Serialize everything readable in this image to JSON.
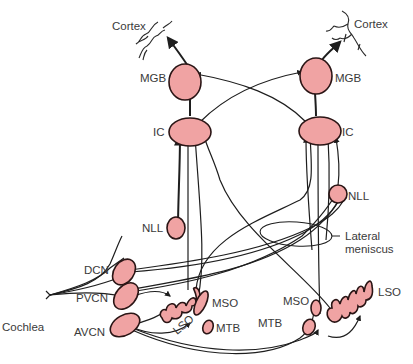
{
  "diagram": {
    "colors": {
      "nucleus_fill": "#f0a3a3",
      "nucleus_stroke": "#2a1515",
      "fiber": "#1e1e1e",
      "label": "#3a3a3a",
      "background": "#ffffff"
    },
    "labels": {
      "cortex_left": "Cortex",
      "cortex_right": "Cortex",
      "mgb_left": "MGB",
      "mgb_right": "MGB",
      "ic_left": "IC",
      "ic_right": "IC",
      "nll_left": "NLL",
      "nll_right": "NLL",
      "lateral_meniscus_1": "Lateral",
      "lateral_meniscus_2": "meniscus",
      "dcn": "DCN",
      "pvcn": "PVCN",
      "avcn": "AVCN",
      "cochlea": "Cochlea",
      "lso_left": "LSO",
      "mso_left": "MSO",
      "mtb_left": "MTB",
      "mso_right": "MSO",
      "mtb_right": "MTB",
      "lso_right": "LSO"
    },
    "nodes": [
      {
        "id": "cortex_left",
        "label": "Cortex"
      },
      {
        "id": "cortex_right",
        "label": "Cortex"
      },
      {
        "id": "mgb_left",
        "label": "MGB"
      },
      {
        "id": "mgb_right",
        "label": "MGB"
      },
      {
        "id": "ic_left",
        "label": "IC"
      },
      {
        "id": "ic_right",
        "label": "IC"
      },
      {
        "id": "nll_left",
        "label": "NLL"
      },
      {
        "id": "nll_right",
        "label": "NLL"
      },
      {
        "id": "dcn",
        "label": "DCN"
      },
      {
        "id": "pvcn",
        "label": "PVCN"
      },
      {
        "id": "avcn",
        "label": "AVCN"
      },
      {
        "id": "lso_left",
        "label": "LSO"
      },
      {
        "id": "mso_left",
        "label": "MSO"
      },
      {
        "id": "mtb_left",
        "label": "MTB"
      },
      {
        "id": "mso_right",
        "label": "MSO"
      },
      {
        "id": "mtb_right",
        "label": "MTB"
      },
      {
        "id": "lso_right",
        "label": "LSO"
      }
    ],
    "edges": [
      {
        "from": "cochlea",
        "to": "dcn"
      },
      {
        "from": "cochlea",
        "to": "pvcn"
      },
      {
        "from": "cochlea",
        "to": "avcn"
      },
      {
        "from": "pvcn",
        "to": "lso_left"
      },
      {
        "from": "avcn",
        "to": "lso_left"
      },
      {
        "from": "avcn",
        "to": "mso_left"
      },
      {
        "from": "avcn",
        "to": "mtb_right"
      },
      {
        "from": "avcn",
        "to": "mso_right"
      },
      {
        "from": "mtb_right",
        "to": "lso_right"
      },
      {
        "from": "dcn",
        "to": "nll_right"
      },
      {
        "from": "pvcn",
        "to": "nll_right"
      },
      {
        "from": "dcn",
        "to": "ic_right"
      },
      {
        "from": "pvcn",
        "to": "ic_right"
      },
      {
        "from": "lso_left",
        "to": "ic_left"
      },
      {
        "from": "mso_left",
        "to": "ic_left"
      },
      {
        "from": "nll_left",
        "to": "ic_left"
      },
      {
        "from": "lso_left",
        "to": "ic_right"
      },
      {
        "from": "lso_right",
        "to": "ic_left"
      },
      {
        "from": "mso_right",
        "to": "ic_right"
      },
      {
        "from": "nll_right",
        "to": "ic_right"
      },
      {
        "from": "ic_left",
        "to": "mgb_left"
      },
      {
        "from": "ic_right",
        "to": "mgb_right"
      },
      {
        "from": "ic_left",
        "to": "mgb_right"
      },
      {
        "from": "ic_right",
        "to": "mgb_left"
      },
      {
        "from": "mgb_left",
        "to": "cortex_left"
      },
      {
        "from": "mgb_right",
        "to": "cortex_right"
      }
    ]
  }
}
